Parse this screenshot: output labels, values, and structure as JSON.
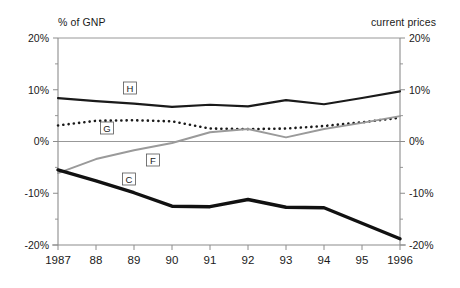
{
  "header": {
    "left_note": "% of GNP",
    "right_note": "current prices"
  },
  "chart_data": {
    "type": "line",
    "title": "",
    "subtitle": "",
    "xlabel": "",
    "ylabel": "% of GNP",
    "ylabel_right": "current prices",
    "grid": false,
    "legend": "inline-tags",
    "ylim": [
      -20,
      20
    ],
    "ytick_labels_left": [
      "20%",
      "10%",
      "0%",
      "-10%",
      "-20%"
    ],
    "ytick_labels_right": [
      "20%",
      "10%",
      "0%",
      "-10%",
      "-20%"
    ],
    "ytick_values": [
      20,
      10,
      0,
      -10,
      -20
    ],
    "yminor_values": [
      15,
      5,
      -5,
      -15
    ],
    "x": [
      1987,
      1988,
      1989,
      1990,
      1991,
      1992,
      1993,
      1994,
      1995,
      1996
    ],
    "categories": [
      "1987",
      "88",
      "89",
      "90",
      "91",
      "92",
      "93",
      "94",
      "95",
      "1996"
    ],
    "series": [
      {
        "name": "H",
        "label": "H",
        "style": "solid",
        "color": "#1a1a1a",
        "width": 2.2,
        "values": [
          8.4,
          7.8,
          7.3,
          6.7,
          7.1,
          6.8,
          8.0,
          7.2,
          8.4,
          9.7
        ]
      },
      {
        "name": "G",
        "label": "G",
        "style": "dotted",
        "color": "#1a1a1a",
        "width": 2.6,
        "values": [
          3.1,
          4.0,
          4.1,
          3.9,
          2.5,
          2.4,
          2.5,
          3.0,
          3.7,
          4.6
        ]
      },
      {
        "name": "F",
        "label": "F",
        "style": "solid",
        "color": "#9a9a9a",
        "width": 2.0,
        "values": [
          -6.1,
          -3.4,
          -1.7,
          -0.3,
          1.8,
          2.4,
          0.8,
          2.4,
          3.6,
          4.9
        ]
      },
      {
        "name": "C",
        "label": "C",
        "style": "solid",
        "color": "#111111",
        "width": 3.4,
        "values": [
          -5.5,
          -7.6,
          -9.9,
          -12.5,
          -12.6,
          -11.2,
          -12.7,
          -12.8,
          -15.8,
          -18.8
        ]
      }
    ],
    "series_tags": [
      {
        "label": "H",
        "x_px": 130,
        "y_px": 88
      },
      {
        "label": "G",
        "x_px": 107,
        "y_px": 128
      },
      {
        "label": "F",
        "x_px": 153,
        "y_px": 160
      },
      {
        "label": "C",
        "x_px": 129,
        "y_px": 179
      }
    ]
  },
  "plot_geometry": {
    "left_px": 58,
    "right_px": 400,
    "top_px": 38,
    "bottom_px": 245
  }
}
